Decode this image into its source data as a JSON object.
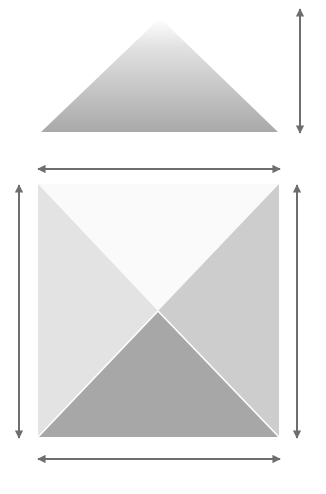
{
  "diagram": {
    "title": "",
    "colors": {
      "background": "#ffffff",
      "arrow": "#6e6e6e",
      "elevation_gradient_top": "#ffffff",
      "elevation_gradient_bottom": "#a9a9a9",
      "face_top": "#fafafa",
      "face_left": "#e3e3e3",
      "face_right": "#cdcdcd",
      "face_bottom": "#a7a7a7",
      "face_edge": "#ffffff"
    },
    "elevation": {
      "apex": [
        160,
        18
      ],
      "base_left": [
        41,
        132
      ],
      "base_right": [
        278,
        132
      ]
    },
    "plan": {
      "left": 38,
      "top": 184,
      "right": 279,
      "bottom": 437,
      "center": [
        158,
        311
      ]
    },
    "arrows": [
      {
        "name": "height-arrow",
        "orientation": "vertical",
        "x": 300,
        "y1": 9,
        "y2": 133
      },
      {
        "name": "top-width-arrow",
        "orientation": "horizontal",
        "y": 169,
        "x1": 38,
        "x2": 280
      },
      {
        "name": "left-depth-arrow",
        "orientation": "vertical",
        "x": 19,
        "y1": 185,
        "y2": 438
      },
      {
        "name": "right-depth-arrow",
        "orientation": "vertical",
        "x": 297,
        "y1": 185,
        "y2": 438
      },
      {
        "name": "bottom-width-arrow",
        "orientation": "horizontal",
        "y": 459,
        "x1": 38,
        "x2": 280
      }
    ]
  }
}
